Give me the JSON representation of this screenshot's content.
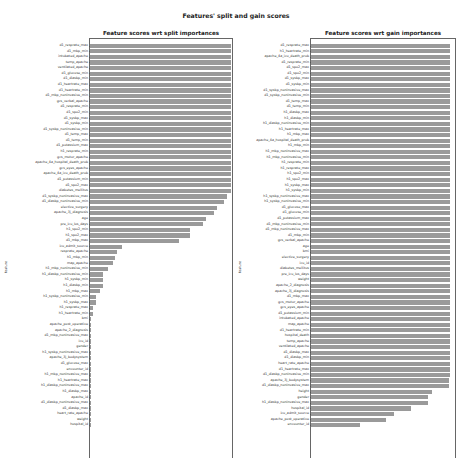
{
  "suptitle": "Features' split and gain scores",
  "chart_data": [
    {
      "type": "bar",
      "orientation": "horizontal",
      "title": "Feature scores wrt split importances",
      "ylabel": "feature",
      "xlabel": "",
      "grid": false,
      "legend": "none",
      "xlim": [
        0,
        1.02
      ],
      "categories": [
        "d1_resprate_max",
        "d1_mbp_min",
        "intubated_apache",
        "temp_apache",
        "ventilated_apache",
        "d1_glucose_min",
        "d1_diasbp_min",
        "d1_heartrate_max",
        "d1_heartrate_min",
        "d1_mbp_noninvasive_min",
        "gcs_verbal_apache",
        "d1_resprate_min",
        "d1_spo2_min",
        "d1_sysbp_max",
        "d1_sysbp_min",
        "d1_sysbp_noninvasive_min",
        "d1_temp_max",
        "d1_temp_min",
        "d1_potassium_max",
        "h1_resprate_min",
        "gcs_motor_apache",
        "apache_4a_hospital_death_prob",
        "gcs_eyes_apache",
        "apache_4a_icu_death_prob",
        "d1_potassium_min",
        "d1_spo2_max",
        "diabetes_mellitus",
        "d1_sysbp_noninvasive_max",
        "d1_diasbp_noninvasive_min",
        "elective_surgery",
        "apache_3j_diagnosis",
        "age",
        "pre_icu_los_days",
        "h1_spo2_min",
        "h1_spo2_max",
        "d1_mbp_max",
        "icu_admit_source",
        "resprate_apache",
        "h1_mbp_min",
        "map_apache",
        "h1_mbp_noninvasive_min",
        "h1_diasbp_noninvasive_min",
        "h1_sysbp_min",
        "h1_diasbp_min",
        "h1_mbp_max",
        "h1_sysbp_noninvasive_min",
        "h1_sysbp_max",
        "h1_resprate_max",
        "h1_heartrate_min",
        "bmi",
        "apache_post_operative",
        "apache_2_diagnosis",
        "d1_mbp_noninvasive_max",
        "icu_id",
        "gender",
        "h1_sysbp_noninvasive_max",
        "apache_3j_bodysystem",
        "d1_glucose_max",
        "encounter_id",
        "h1_mbp_noninvasive_max",
        "h1_heartrate_max",
        "h1_diasbp_noninvasive_max",
        "h1_diasbp_max",
        "apache_id",
        "d1_diasbp_noninvasive_max",
        "d1_diasbp_max",
        "heart_rate_apache",
        "weight",
        "hospital_id"
      ],
      "values": [
        1.0,
        1.0,
        1.0,
        1.0,
        1.0,
        1.0,
        1.0,
        1.0,
        1.0,
        1.0,
        1.0,
        1.0,
        1.0,
        1.0,
        1.0,
        1.0,
        1.0,
        1.0,
        1.0,
        1.0,
        1.0,
        1.0,
        1.0,
        1.0,
        1.0,
        1.0,
        1.0,
        0.97,
        0.95,
        0.9,
        0.88,
        0.82,
        0.8,
        0.71,
        0.71,
        0.63,
        0.23,
        0.19,
        0.18,
        0.16,
        0.13,
        0.09,
        0.09,
        0.09,
        0.07,
        0.04,
        0.04,
        0.02,
        0.02,
        0.01,
        0.01,
        0.01,
        0.01,
        0.01,
        0.01,
        0.0,
        0.0,
        0.0,
        0.0,
        0.0,
        0.0,
        0.0,
        0.0,
        0.0,
        0.0,
        0.0,
        0.0,
        0.0,
        0.0
      ]
    },
    {
      "type": "bar",
      "orientation": "horizontal",
      "title": "Feature scores wrt gain importances",
      "ylabel": "feature",
      "xlabel": "",
      "grid": false,
      "legend": "none",
      "xlim": [
        0,
        1.05
      ],
      "categories": [
        "d1_resprate_max",
        "h1_heartrate_min",
        "apache_4a_icu_death_prob",
        "d1_resprate_min",
        "d1_spo2_max",
        "d1_spo2_min",
        "d1_sysbp_max",
        "d1_sysbp_min",
        "d1_sysbp_noninvasive_max",
        "d1_sysbp_noninvasive_min",
        "d1_temp_max",
        "d1_temp_min",
        "h1_diasbp_max",
        "h1_diasbp_min",
        "h1_diasbp_noninvasive_min",
        "h1_heartrate_max",
        "h1_mbp_max",
        "apache_4a_hospital_death_prob",
        "h1_mbp_min",
        "h1_mbp_noninvasive_max",
        "h1_mbp_noninvasive_min",
        "h1_resprate_min",
        "h1_resprate_max",
        "h1_spo2_min",
        "h1_spo2_max",
        "h1_sysbp_max",
        "h1_sysbp_min",
        "h1_sysbp_noninvasive_max",
        "h1_sysbp_noninvasive_min",
        "d1_glucose_max",
        "d1_glucose_min",
        "d1_potassium_max",
        "d1_mbp_noninvasive_min",
        "d1_mbp_noninvasive_max",
        "d1_mbp_min",
        "gcs_verbal_apache",
        "age",
        "bmi",
        "elective_surgery",
        "icu_id",
        "diabetes_mellitus",
        "pre_icu_los_days",
        "weight",
        "apache_2_diagnosis",
        "apache_3j_diagnosis",
        "d1_mbp_max",
        "gcs_motor_apache",
        "gcs_eyes_apache",
        "d1_potassium_min",
        "intubated_apache",
        "map_apache",
        "d1_heartrate_min",
        "hospital_death",
        "temp_apache",
        "ventilated_apache",
        "d1_diasbp_max",
        "d1_diasbp_min",
        "heart_rate_apache",
        "d1_heartrate_max",
        "d1_diasbp_noninvasive_min",
        "apache_3j_bodysystem",
        "d1_diasbp_noninvasive_max",
        "height",
        "gender",
        "h1_diasbp_noninvasive_max",
        "hospital_id",
        "icu_admit_source",
        "apache_post_operative",
        "encounter_id"
      ],
      "values": [
        1.0,
        1.0,
        1.0,
        1.0,
        1.0,
        1.0,
        1.0,
        1.0,
        1.0,
        1.0,
        1.0,
        1.0,
        1.0,
        1.0,
        1.0,
        1.0,
        1.0,
        1.0,
        1.0,
        1.0,
        1.0,
        1.0,
        1.0,
        1.0,
        1.0,
        1.0,
        1.0,
        1.0,
        1.0,
        1.0,
        1.0,
        1.0,
        1.0,
        1.0,
        1.0,
        1.0,
        1.0,
        1.0,
        1.0,
        1.0,
        1.0,
        1.0,
        1.0,
        1.0,
        1.0,
        1.0,
        1.0,
        1.0,
        1.0,
        1.0,
        1.0,
        1.0,
        1.0,
        1.0,
        1.0,
        1.0,
        1.0,
        1.0,
        1.0,
        1.0,
        0.99,
        0.99,
        0.87,
        0.84,
        0.84,
        0.72,
        0.6,
        0.54,
        0.35
      ]
    }
  ],
  "colors": {
    "bar": "#9a9a9a",
    "axis": "#666666",
    "text": "#333333"
  }
}
